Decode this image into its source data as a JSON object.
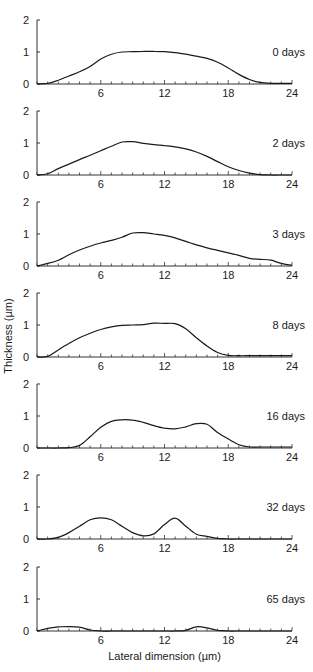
{
  "chart_data": {
    "type": "line",
    "title": "",
    "xlabel": "Lateral dimension (µm)",
    "ylabel": "Thickness (µm)",
    "xlim": [
      0,
      24
    ],
    "ylim": [
      0,
      2
    ],
    "x_ticks": [
      6,
      12,
      18,
      24
    ],
    "x_minor_tick_step": 1,
    "y_ticks": [
      0,
      1,
      2
    ],
    "grid": false,
    "legend": "none; each panel labeled at right",
    "layout": "7 vertically stacked panels sharing x-axis",
    "panels": [
      {
        "label": "0 days",
        "x": [
          0,
          1,
          2,
          3,
          4,
          5,
          6,
          7,
          8,
          9,
          10,
          11,
          12,
          13,
          14,
          15,
          16,
          17,
          18,
          19,
          20,
          21,
          22,
          23,
          24
        ],
        "y": [
          0,
          0.02,
          0.12,
          0.25,
          0.38,
          0.55,
          0.78,
          0.93,
          1.0,
          1.01,
          1.02,
          1.02,
          1.01,
          0.98,
          0.93,
          0.87,
          0.8,
          0.68,
          0.5,
          0.3,
          0.14,
          0.05,
          0.02,
          0.02,
          0.02
        ]
      },
      {
        "label": "2 days",
        "x": [
          0,
          1,
          2,
          3,
          4,
          5,
          6,
          7,
          8,
          9,
          10,
          11,
          12,
          13,
          14,
          15,
          16,
          17,
          18,
          19,
          20,
          21,
          22,
          23,
          24
        ],
        "y": [
          0,
          0.04,
          0.2,
          0.34,
          0.48,
          0.62,
          0.76,
          0.9,
          1.03,
          1.04,
          0.99,
          0.95,
          0.92,
          0.88,
          0.82,
          0.72,
          0.58,
          0.42,
          0.26,
          0.14,
          0.06,
          0.01,
          0,
          0,
          0
        ]
      },
      {
        "label": "3 days",
        "x": [
          0,
          1,
          2,
          3,
          4,
          5,
          6,
          7,
          8,
          9,
          10,
          11,
          12,
          13,
          14,
          15,
          16,
          17,
          18,
          19,
          20,
          21,
          22,
          23,
          24
        ],
        "y": [
          0,
          0.08,
          0.18,
          0.35,
          0.5,
          0.62,
          0.72,
          0.8,
          0.9,
          1.03,
          1.04,
          1.0,
          0.96,
          0.88,
          0.77,
          0.66,
          0.57,
          0.49,
          0.41,
          0.33,
          0.24,
          0.21,
          0.18,
          0.08,
          0.02
        ]
      },
      {
        "label": "8 days",
        "x": [
          0,
          1,
          2,
          3,
          4,
          5,
          6,
          7,
          8,
          9,
          10,
          11,
          12,
          13,
          14,
          15,
          16,
          17,
          18,
          19,
          20,
          21,
          22,
          23,
          24
        ],
        "y": [
          0,
          0.02,
          0.22,
          0.42,
          0.6,
          0.74,
          0.86,
          0.94,
          0.99,
          1.0,
          1.01,
          1.06,
          1.05,
          1.04,
          0.88,
          0.6,
          0.34,
          0.14,
          0.05,
          0.04,
          0.04,
          0.04,
          0.04,
          0.04,
          0.04
        ]
      },
      {
        "label": "16 days",
        "x": [
          0,
          1,
          2,
          3,
          4,
          5,
          6,
          7,
          8,
          9,
          10,
          11,
          12,
          13,
          14,
          15,
          16,
          17,
          18,
          19,
          20,
          21,
          22,
          23,
          24
        ],
        "y": [
          0,
          0,
          0,
          0.01,
          0.08,
          0.35,
          0.65,
          0.83,
          0.88,
          0.87,
          0.8,
          0.7,
          0.62,
          0.6,
          0.66,
          0.76,
          0.74,
          0.48,
          0.28,
          0.1,
          0.03,
          0.03,
          0.03,
          0.03,
          0.03
        ]
      },
      {
        "label": "32 days",
        "x": [
          0,
          1,
          2,
          3,
          4,
          5,
          6,
          7,
          8,
          9,
          10,
          11,
          12,
          13,
          14,
          15,
          16,
          17,
          18,
          19,
          20,
          21,
          22,
          23,
          24
        ],
        "y": [
          0,
          0,
          0.05,
          0.2,
          0.4,
          0.6,
          0.66,
          0.6,
          0.4,
          0.2,
          0.1,
          0.16,
          0.45,
          0.65,
          0.4,
          0.15,
          0.08,
          0.02,
          0,
          0,
          0,
          0,
          0,
          0,
          0
        ]
      },
      {
        "label": "65 days",
        "x": [
          0,
          1,
          2,
          3,
          4,
          5,
          6,
          7,
          8,
          9,
          10,
          11,
          12,
          13,
          14,
          15,
          16,
          17,
          18,
          19,
          20,
          21,
          22,
          23,
          24
        ],
        "y": [
          0,
          0.08,
          0.13,
          0.14,
          0.12,
          0.03,
          0,
          0,
          0,
          0,
          0,
          0,
          0,
          0,
          0.02,
          0.13,
          0.1,
          0.02,
          0,
          0,
          0,
          0,
          0,
          0,
          0
        ]
      }
    ]
  }
}
